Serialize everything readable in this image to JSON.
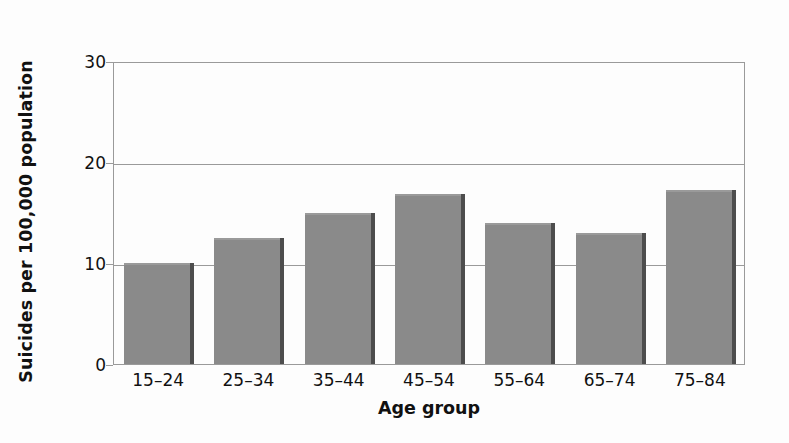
{
  "chart_data": {
    "type": "bar",
    "title": "",
    "xlabel": "Age group",
    "ylabel": "Suicides per 100,000 population",
    "categories": [
      "15–24",
      "25–34",
      "35–44",
      "45–54",
      "55–64",
      "65–74",
      "75–84"
    ],
    "values": [
      10.0,
      12.5,
      15.0,
      16.8,
      14.0,
      13.0,
      17.2
    ],
    "ylim": [
      0,
      30
    ],
    "yticks": [
      0,
      10,
      20,
      30
    ],
    "ytick_labels": [
      "0",
      "10",
      "20",
      "30"
    ],
    "grid": "horizontal",
    "legend": "none",
    "series": [
      {
        "name": "Suicides per 100,000 population",
        "values": [
          10.0,
          12.5,
          15.0,
          16.8,
          14.0,
          13.0,
          17.2
        ]
      }
    ],
    "colors": {
      "bar_fill": "#8a8a8a",
      "bar_shadow": "#4d4d4d",
      "axis": "#9a9a9a",
      "text": "#111111",
      "background": "#fdfdfd"
    }
  }
}
